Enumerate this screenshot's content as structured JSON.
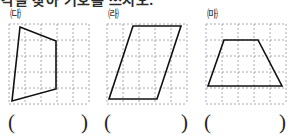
{
  "heading": {
    "text": "각을 찾아 기호를 쓰시오."
  },
  "figures": [
    {
      "label": "㈐",
      "name": "figure-trapezoid-left",
      "grid": {
        "cols": 5,
        "rows": 5,
        "cell": 16,
        "color": "#9aa0b4",
        "dash": "2 2"
      },
      "shape": {
        "type": "quadrilateral",
        "points": "12,4 48,18 48,66 4,78",
        "stroke": "#111111",
        "stroke_width": 1.6
      }
    },
    {
      "label": "㈑",
      "name": "figure-parallelogram-middle",
      "grid": {
        "cols": 5,
        "rows": 5,
        "cell": 16,
        "color": "#9aa0b4",
        "dash": "2 2"
      },
      "shape": {
        "type": "parallelogram",
        "points": "27,3 75,3 51,76 3,76",
        "stroke": "#111111",
        "stroke_width": 1.6
      }
    },
    {
      "label": "㈒",
      "name": "figure-trapezoid-right",
      "grid": {
        "cols": 5,
        "rows": 5,
        "cell": 16,
        "color": "#9aa0b4",
        "dash": "2 2"
      },
      "shape": {
        "type": "trapezoid",
        "points": "19,17 53,17 77,63 3,63",
        "stroke": "#111111",
        "stroke_width": 1.6
      }
    }
  ],
  "answers": [
    {
      "name": "answer-blank-1",
      "open": "(",
      "value": "",
      "close": ")"
    },
    {
      "name": "answer-blank-2",
      "open": "(",
      "value": "",
      "close": ")"
    },
    {
      "name": "answer-blank-3",
      "open": "(",
      "value": "",
      "close": ")"
    }
  ],
  "chart_data": {
    "type": "table",
    "categories": [
      "㈐",
      "㈑",
      "㈒"
    ],
    "values": [
      4,
      4,
      4
    ],
    "xlabel": "figure label",
    "ylabel": "number of sides"
  }
}
